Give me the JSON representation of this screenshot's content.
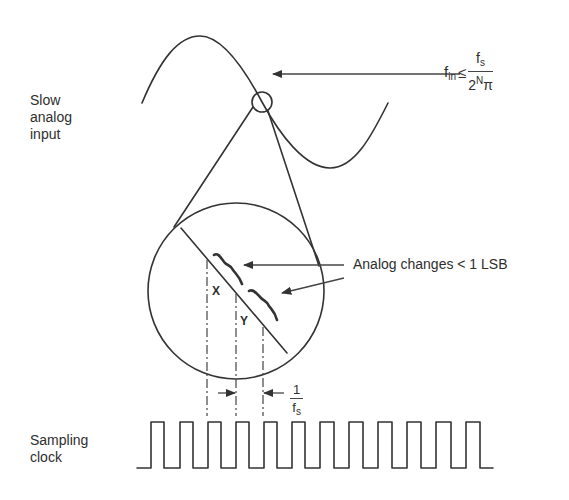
{
  "diagram": {
    "labels": {
      "slow_input_line1": "Slow",
      "slow_input_line2": "analog",
      "slow_input_line3": "input",
      "sampling_clock_line1": "Sampling",
      "sampling_clock_line2": "clock",
      "analog_changes": "Analog changes < 1 LSB",
      "x_marker": "X",
      "y_marker": "Y"
    },
    "formula": {
      "lhs_base": "f",
      "lhs_sub": "in",
      "relation": "≤",
      "numerator_base": "f",
      "numerator_sub": "s",
      "denominator_base": "2",
      "denominator_sup": "N",
      "denominator_pi": "π"
    },
    "period_fraction": {
      "numerator": "1",
      "denominator_base": "f",
      "denominator_sub": "s"
    },
    "colors": {
      "stroke": "#333333",
      "background": "#ffffff"
    },
    "clock_pulse_count": 12
  }
}
